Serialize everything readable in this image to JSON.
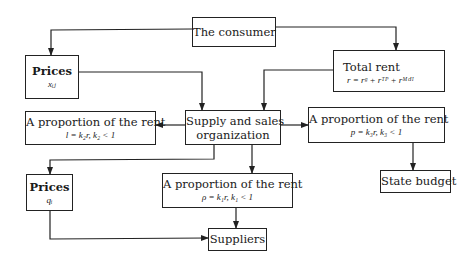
{
  "diagram": {
    "nodes": {
      "consumer": {
        "title": "The consumer"
      },
      "prices_x": {
        "title": "Prices",
        "formula": "xᵢⱼ"
      },
      "total_rent": {
        "title": "Total rent",
        "formula": "r = rᵍ + rᵀᴾ + rᴹᶜᴴ"
      },
      "supply": {
        "title_line1": "Supply and sales",
        "title_line2": "organization"
      },
      "prop_left": {
        "title": "A proportion of the rent",
        "formula": "l = k₂r,  k₂ < 1"
      },
      "prop_right": {
        "title": "A proportion of the rent",
        "formula": "p = k₃r,  k₃ < 1"
      },
      "prices_q": {
        "title": "Prices",
        "formula": "qᵢ"
      },
      "prop_mid": {
        "title": "A proportion of the rent",
        "formula": "ρ = k₁r,  k₁ < 1"
      },
      "state_budget": {
        "title": "State budget"
      },
      "suppliers": {
        "title": "Suppliers"
      }
    },
    "edges": [
      {
        "from": "consumer",
        "to": "prices_x"
      },
      {
        "from": "consumer",
        "to": "total_rent"
      },
      {
        "from": "prices_x",
        "to": "supply"
      },
      {
        "from": "total_rent",
        "to": "supply"
      },
      {
        "from": "supply",
        "to": "prop_left"
      },
      {
        "from": "supply",
        "to": "prop_right"
      },
      {
        "from": "supply",
        "to": "prices_q"
      },
      {
        "from": "supply",
        "to": "prop_mid"
      },
      {
        "from": "prop_right",
        "to": "state_budget"
      },
      {
        "from": "prop_mid",
        "to": "suppliers"
      },
      {
        "from": "prices_q",
        "to": "suppliers"
      }
    ],
    "colors": {
      "line": "#222222",
      "background": "#ffffff"
    }
  }
}
